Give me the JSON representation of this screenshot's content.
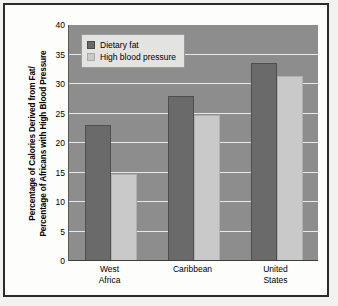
{
  "chart_data": {
    "type": "bar",
    "title": "",
    "xlabel": "",
    "ylabel_line1": "Percentage of Calories Derived from Fat/",
    "ylabel_line2": "Percentage of Africans with High Blood Pressure",
    "categories": [
      "West Africa",
      "Caribbean",
      "United States"
    ],
    "category_lines": [
      [
        "West",
        "Africa"
      ],
      [
        "Caribbean",
        ""
      ],
      [
        "United",
        "States"
      ]
    ],
    "series": [
      {
        "name": "Dietary fat",
        "color": "#6a6a6a",
        "values": [
          23,
          28,
          33.5
        ]
      },
      {
        "name": "High blood pressure",
        "color": "#c9c9c9",
        "values": [
          14.8,
          24.8,
          31.3
        ]
      }
    ],
    "ylim": [
      0,
      40
    ],
    "yticks": [
      0,
      5,
      10,
      15,
      20,
      25,
      30,
      35,
      40
    ],
    "ytick_labels": [
      "0",
      "5",
      "10",
      "15",
      "20",
      "25",
      "30",
      "35",
      "40"
    ],
    "grid": true,
    "legend_position": "top-left-inside",
    "plot_background": "#8d8d8d",
    "gridline_color": "#e8e8e8",
    "page_background": "#fdfdfb",
    "frame_color": "#2b2b2b"
  }
}
